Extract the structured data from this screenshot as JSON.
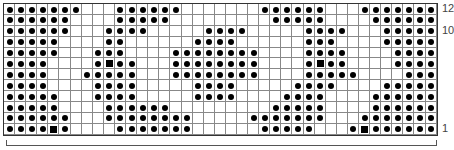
{
  "chart": {
    "rows": 12,
    "cols": 39,
    "legend": {
      "x": "dot stitch",
      "s": "square stitch",
      ".": "empty"
    },
    "row_labels": [
      {
        "text": "12",
        "row": 12
      },
      {
        "text": "10",
        "row": 10
      },
      {
        "text": "1",
        "row": 1
      }
    ],
    "grid_top_to_bottom": [
      "xxxxxxx...xxxxxx.......xxxxxx...xxxxxxx",
      "xxxxxx....xxxxx.........xxxxx....xxxxxx",
      "xxxxxx...xxxx.....xxxx.....xxxx...xxxxx",
      "xxxxx....xx......xxxx......xxx....xxxxx",
      "xxxxx...xxx....xxxxxxxx....xxxx....xxxx",
      "xxxx....xsxx...xxxxxxxx....xsxx....xxxx",
      "xxxx...xxxxx...xxxxxxxx....xxxxx....xxx",
      "xxxx....xxxx.....xxxx.....xxxx....xxxxx",
      "xxxxx...xxxx.....xxxx....xxxx....xxxxxx",
      "xxxxx....xxxxxx.........xxxxx....xxxxxx",
      "xxxxxx...xxxxxxxx.....xxxxxxx...xxxxxxx",
      "xxxxsx....xxxxxxx......xxxxx...xsxxxxxx"
    ]
  }
}
